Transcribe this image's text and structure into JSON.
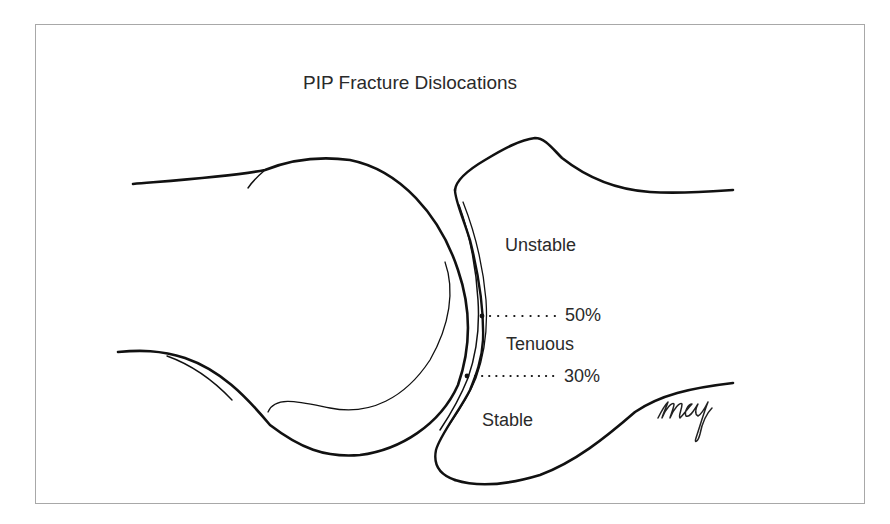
{
  "diagram": {
    "title": "PIP Fracture Dislocations",
    "zones": [
      {
        "label": "Unstable"
      },
      {
        "label": "Tenuous"
      },
      {
        "label": "Stable"
      }
    ],
    "thresholds": [
      {
        "label": "50%"
      },
      {
        "label": "30%"
      }
    ],
    "signature": "mcg",
    "colors": {
      "line": "#111111",
      "text": "#2a2a2a",
      "frame": "#a8a8a8",
      "background": "#ffffff"
    }
  }
}
